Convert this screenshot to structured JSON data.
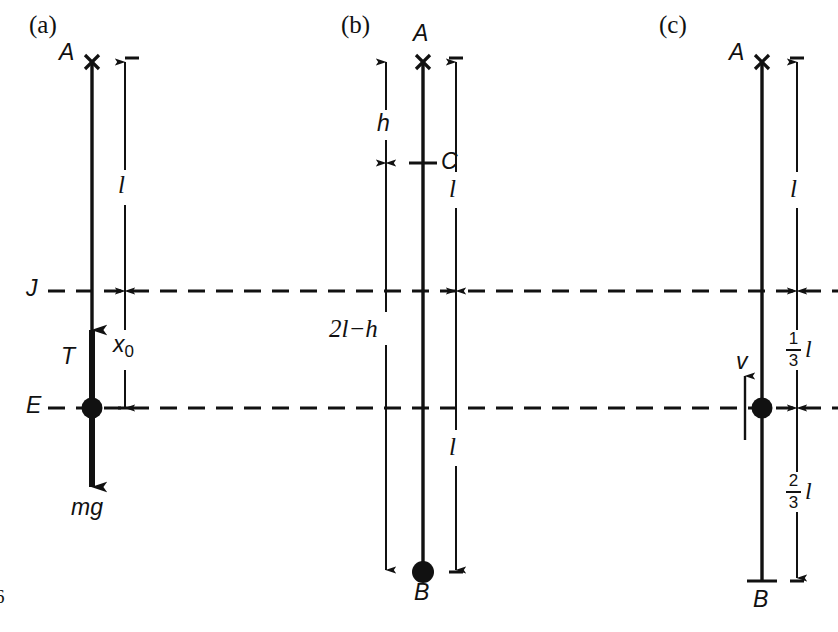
{
  "figure": {
    "width": 838,
    "height": 632,
    "background": "#ffffff",
    "ink": "#111111",
    "page_number": "6"
  },
  "reference_lines": [
    {
      "name": "J",
      "label": "J",
      "y": 291,
      "style": "dashed"
    },
    {
      "name": "E",
      "label": "E",
      "y": 408,
      "style": "dashed"
    }
  ],
  "panels": [
    {
      "id": "a",
      "tag": "(a)",
      "points": [
        {
          "name": "A",
          "label": "A",
          "marker": "cross"
        },
        {
          "name": "J",
          "label": "J",
          "marker": "line-crossing"
        },
        {
          "name": "E",
          "label": "E",
          "marker": "filled-ball"
        }
      ],
      "forces": [
        {
          "name": "T",
          "label": "T",
          "direction": "up"
        },
        {
          "name": "mg",
          "label": "mg",
          "direction": "down"
        }
      ],
      "dimensions": [
        {
          "name": "l",
          "label": "l",
          "from": "A",
          "to": "J"
        },
        {
          "name": "x0",
          "label": "x",
          "sub": "0",
          "from": "J",
          "to": "E"
        }
      ]
    },
    {
      "id": "b",
      "tag": "(b)",
      "points": [
        {
          "name": "A",
          "label": "A",
          "marker": "cross"
        },
        {
          "name": "C",
          "label": "C",
          "marker": "tick"
        },
        {
          "name": "B",
          "label": "B",
          "marker": "filled-ball"
        }
      ],
      "dimensions": [
        {
          "name": "h",
          "label": "h",
          "from": "A",
          "to": "C"
        },
        {
          "name": "2l-h",
          "label": "2l−h",
          "from": "C",
          "to": "B"
        },
        {
          "name": "l-upper",
          "label": "l",
          "from": "A",
          "to": "J"
        },
        {
          "name": "l-lower",
          "label": "l",
          "from": "J",
          "to": "B"
        }
      ]
    },
    {
      "id": "c",
      "tag": "(c)",
      "points": [
        {
          "name": "A",
          "label": "A",
          "marker": "cross"
        },
        {
          "name": "E",
          "label": "E",
          "marker": "filled-ball"
        },
        {
          "name": "B",
          "label": "B",
          "marker": "tick"
        }
      ],
      "velocity": {
        "name": "v",
        "label": "v",
        "direction": "up"
      },
      "dimensions": [
        {
          "name": "l",
          "label": "l",
          "from": "A",
          "to": "J"
        },
        {
          "name": "one-third-l",
          "numerator": "1",
          "denominator": "3",
          "unit": "l",
          "from": "J",
          "to": "E"
        },
        {
          "name": "two-thirds-l",
          "numerator": "2",
          "denominator": "3",
          "unit": "l",
          "from": "E",
          "to": "B"
        }
      ]
    }
  ]
}
